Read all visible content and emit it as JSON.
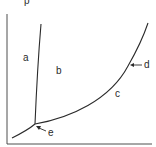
{
  "diagram": {
    "type": "phase-diagram",
    "axis_label_y": "p",
    "labels": {
      "a": "a",
      "b": "b",
      "c": "c",
      "d": "d",
      "e": "e"
    },
    "colors": {
      "line": "#2a2a2a",
      "axis": "#3a3a3a",
      "background": "#ffffff"
    }
  }
}
